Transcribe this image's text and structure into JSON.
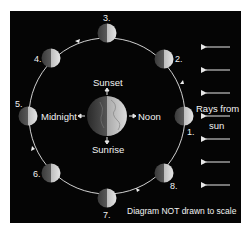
{
  "diagram": {
    "type": "moon-phases-orbit",
    "earth_labels": {
      "top": "Sunset",
      "right": "Noon",
      "bottom": "Sunrise",
      "left": "Midnight"
    },
    "sun_label_line1": "Rays from",
    "sun_label_line2": "sun",
    "footer_note": "Diagram NOT drawn to scale",
    "moon_positions": [
      {
        "label": "1."
      },
      {
        "label": "2."
      },
      {
        "label": "3."
      },
      {
        "label": "4."
      },
      {
        "label": "5."
      },
      {
        "label": "6."
      },
      {
        "label": "7."
      },
      {
        "label": "8."
      }
    ],
    "sun_ray_count": 7,
    "orbit_direction": "counterclockwise",
    "colors": {
      "background": "#050505",
      "text": "#f2f2f2",
      "orbit": "#e8e8e8"
    }
  }
}
